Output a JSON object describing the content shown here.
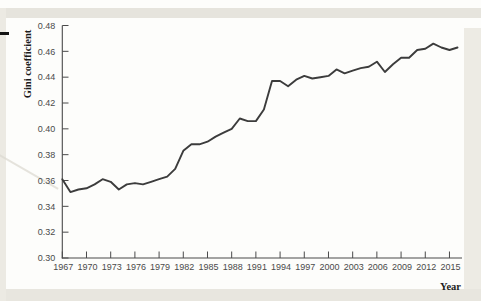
{
  "figure": {
    "ylabel": "Gini coefficient",
    "xlabel": "Year"
  },
  "chart_data": {
    "type": "line",
    "title": "",
    "xlabel": "Year",
    "ylabel": "Gini coefficient",
    "xlim": [
      1967,
      2016.5
    ],
    "ylim": [
      0.3,
      0.48
    ],
    "grid": false,
    "legend": null,
    "line_color": "#3c3c3c",
    "axis_color": "#4a4a4a",
    "tick_label_color": "#4a4a4a",
    "x_ticks": [
      1967,
      1970,
      1973,
      1976,
      1979,
      1982,
      1985,
      1988,
      1991,
      1994,
      1997,
      2000,
      2003,
      2006,
      2009,
      2012,
      2015
    ],
    "y_ticks": [
      0.3,
      0.32,
      0.34,
      0.36,
      0.38,
      0.4,
      0.42,
      0.44,
      0.46,
      0.48
    ],
    "x": [
      1967,
      1968,
      1969,
      1970,
      1971,
      1972,
      1973,
      1974,
      1975,
      1976,
      1977,
      1978,
      1979,
      1980,
      1981,
      1982,
      1983,
      1984,
      1985,
      1986,
      1987,
      1988,
      1989,
      1990,
      1991,
      1992,
      1993,
      1994,
      1995,
      1996,
      1997,
      1998,
      1999,
      2000,
      2001,
      2002,
      2003,
      2004,
      2005,
      2006,
      2007,
      2008,
      2009,
      2010,
      2011,
      2012,
      2013,
      2014,
      2015,
      2016
    ],
    "values": [
      0.361,
      0.351,
      0.353,
      0.354,
      0.357,
      0.361,
      0.359,
      0.353,
      0.357,
      0.358,
      0.357,
      0.359,
      0.361,
      0.363,
      0.369,
      0.383,
      0.388,
      0.388,
      0.39,
      0.394,
      0.397,
      0.4,
      0.408,
      0.406,
      0.406,
      0.415,
      0.437,
      0.437,
      0.433,
      0.438,
      0.441,
      0.439,
      0.44,
      0.441,
      0.446,
      0.443,
      0.445,
      0.447,
      0.448,
      0.452,
      0.444,
      0.45,
      0.455,
      0.455,
      0.461,
      0.462,
      0.466,
      0.463,
      0.461,
      0.463
    ]
  }
}
